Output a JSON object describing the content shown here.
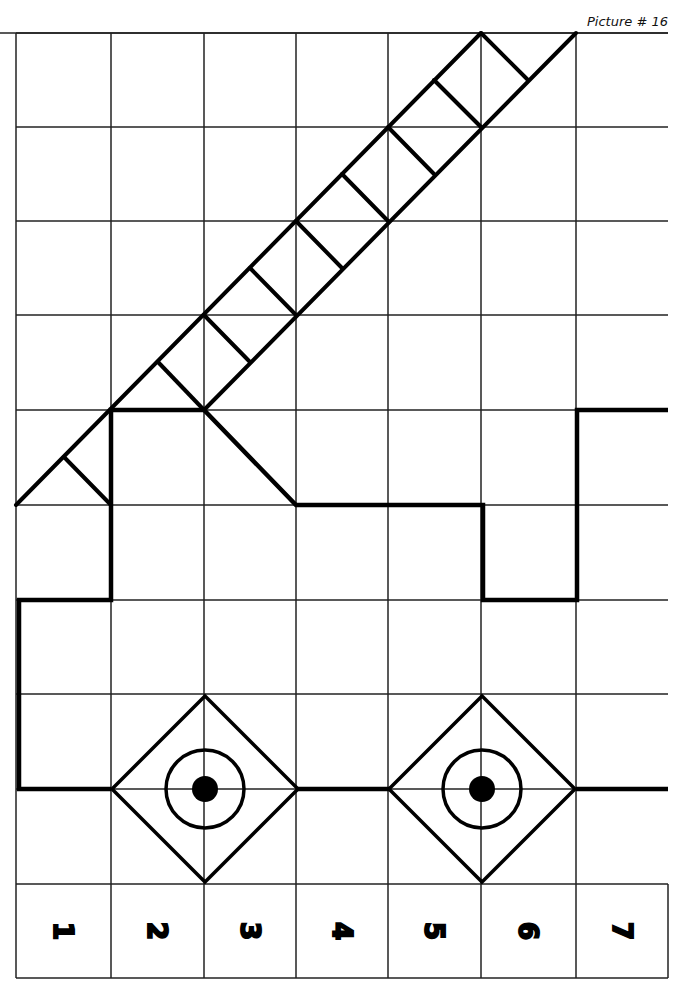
{
  "caption": "Picture # 16",
  "grid": {
    "cols": [
      16,
      111,
      204,
      296,
      388,
      481,
      576,
      668
    ],
    "rows": [
      33,
      127,
      221,
      315,
      410,
      505,
      600,
      694,
      789,
      884
    ],
    "label_row_bottom": 978
  },
  "column_labels": [
    "1",
    "2",
    "3",
    "4",
    "5",
    "6",
    "7"
  ],
  "drawing": {
    "description": "Grid copy exercise: a fire truck with an extended ladder",
    "ladder_rails": [
      [
        [
          16,
          505
        ],
        [
          481,
          33
        ]
      ],
      [
        [
          204,
          410
        ],
        [
          576,
          33
        ]
      ]
    ],
    "ladder_rungs": [
      [
        [
          64,
          457
        ],
        [
          111,
          505
        ]
      ],
      [
        [
          158,
          362
        ],
        [
          204,
          410
        ]
      ],
      [
        [
          204,
          315
        ],
        [
          250,
          362
        ]
      ],
      [
        [
          250,
          268
        ],
        [
          296,
          315
        ]
      ],
      [
        [
          296,
          221
        ],
        [
          342,
          268
        ]
      ],
      [
        [
          342,
          174
        ],
        [
          388,
          221
        ]
      ],
      [
        [
          388,
          127
        ],
        [
          434,
          174
        ]
      ],
      [
        [
          434,
          80
        ],
        [
          481,
          127
        ]
      ],
      [
        [
          481,
          33
        ],
        [
          528,
          80
        ]
      ]
    ],
    "body_path": [
      [
        668,
        410
      ],
      [
        577,
        410
      ],
      [
        577,
        600
      ],
      [
        483,
        600
      ],
      [
        483,
        505
      ],
      [
        296,
        505
      ],
      [
        204,
        410
      ],
      [
        111,
        410
      ],
      [
        111,
        600
      ],
      [
        19,
        600
      ],
      [
        19,
        789
      ],
      [
        111,
        789
      ]
    ],
    "axle_segments": [
      [
        [
          297,
          789
        ],
        [
          390,
          789
        ]
      ],
      [
        [
          576,
          789
        ],
        [
          668,
          789
        ]
      ]
    ],
    "wheels": [
      {
        "cx": 205,
        "cy": 789,
        "half_diag": 93,
        "ring_r": 39,
        "hub_r": 13
      },
      {
        "cx": 482,
        "cy": 789,
        "half_diag": 93,
        "ring_r": 39,
        "hub_r": 13
      }
    ],
    "colors": {
      "ink": "#000000",
      "grid": "#222222",
      "paper": "#ffffff"
    }
  }
}
